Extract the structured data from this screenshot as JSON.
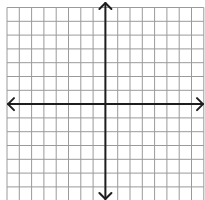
{
  "plane": {
    "width": 205,
    "height": 200,
    "background": "#ffffff",
    "grid": {
      "x_start": 7,
      "x_spacing": 12.3,
      "columns": 16,
      "y_start": 7.5,
      "y_spacing": 13.8,
      "rows": 14,
      "color": "#9a9a9a"
    },
    "axes": {
      "color": "#1e1e1e",
      "y_axis_column": 8,
      "x_axis_row": 7,
      "x_axis": {
        "left_tip": 8,
        "right_tip": 203
      },
      "y_axis": {
        "top_tip": 3,
        "bottom_tip": 199
      },
      "arrow_size": 6
    }
  }
}
